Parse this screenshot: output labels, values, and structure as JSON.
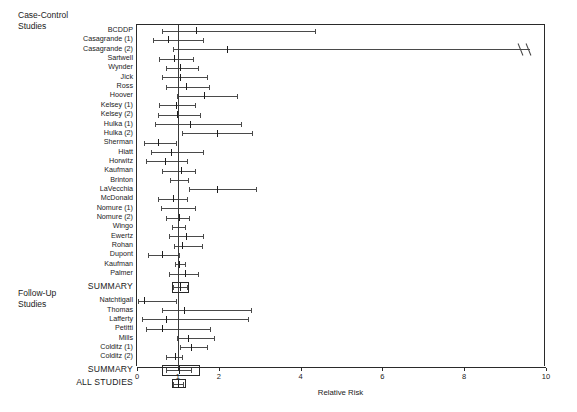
{
  "figure": {
    "axis_title": "Relative Risk",
    "x_ticks": [
      {
        "value": 0,
        "label": "0"
      },
      {
        "value": 1,
        "label": "1"
      },
      {
        "value": 2,
        "label": "2"
      },
      {
        "value": 4,
        "label": "4"
      },
      {
        "value": 6,
        "label": "6"
      },
      {
        "value": 8,
        "label": "8"
      },
      {
        "value": 10,
        "label": "10"
      }
    ],
    "reference_line": 1,
    "group_titles": [
      {
        "name": "case-control-group-title",
        "line1": "Case-Control",
        "line2": "Studies"
      },
      {
        "name": "follow-up-group-title",
        "line1": "Follow-Up",
        "line2": "Studies"
      }
    ]
  },
  "chart_data": {
    "type": "forest",
    "title": "",
    "xlabel": "Relative Risk",
    "ylabel": "",
    "xlim": [
      0,
      10
    ],
    "xticks": [
      0,
      1,
      2,
      4,
      6,
      8,
      10
    ],
    "grid": false,
    "legend": "none",
    "reference_line": 1,
    "groups": [
      {
        "name": "Case-Control Studies",
        "studies": [
          {
            "label": "BCDDP",
            "estimate": 1.45,
            "low": 0.6,
            "high": 4.35,
            "truncated_high": false
          },
          {
            "label": "Casagrande (1)",
            "estimate": 0.75,
            "low": 0.38,
            "high": 1.62,
            "truncated_high": false
          },
          {
            "label": "Casagrande  (2)",
            "estimate": 2.2,
            "low": 0.88,
            "high": 9.6,
            "truncated_high": true
          },
          {
            "label": "Sartwell",
            "estimate": 0.9,
            "low": 0.55,
            "high": 1.38,
            "truncated_high": false
          },
          {
            "label": "Wynder",
            "estimate": 1.05,
            "low": 0.72,
            "high": 1.5,
            "truncated_high": false
          },
          {
            "label": "Jick",
            "estimate": 1.05,
            "low": 0.6,
            "high": 1.72,
            "truncated_high": false
          },
          {
            "label": "Ross",
            "estimate": 1.2,
            "low": 0.72,
            "high": 1.75,
            "truncated_high": false
          },
          {
            "label": "Hoover",
            "estimate": 1.65,
            "low": 0.98,
            "high": 2.45,
            "truncated_high": false
          },
          {
            "label": "Kelsey (1)",
            "estimate": 0.95,
            "low": 0.55,
            "high": 1.42,
            "truncated_high": false
          },
          {
            "label": "Kelsey (2)",
            "estimate": 0.98,
            "low": 0.52,
            "high": 1.55,
            "truncated_high": false
          },
          {
            "label": "Hulka (1)",
            "estimate": 1.3,
            "low": 0.45,
            "high": 2.55,
            "truncated_high": false
          },
          {
            "label": "Hulka (2)",
            "estimate": 1.95,
            "low": 1.1,
            "high": 2.82,
            "truncated_high": false
          },
          {
            "label": "Sherman",
            "estimate": 0.52,
            "low": 0.18,
            "high": 0.95,
            "truncated_high": false
          },
          {
            "label": "Hiatt",
            "estimate": 0.82,
            "low": 0.35,
            "high": 1.62,
            "truncated_high": false
          },
          {
            "label": "Horwitz",
            "estimate": 0.68,
            "low": 0.22,
            "high": 1.22,
            "truncated_high": false
          },
          {
            "label": "Kaufman",
            "estimate": 1.08,
            "low": 0.62,
            "high": 1.42,
            "truncated_high": false
          },
          {
            "label": "Brinton",
            "estimate": 1.0,
            "low": 0.8,
            "high": 1.25,
            "truncated_high": false
          },
          {
            "label": "LaVecchia",
            "estimate": 1.95,
            "low": 1.28,
            "high": 2.9,
            "truncated_high": false
          },
          {
            "label": "McDonald",
            "estimate": 0.88,
            "low": 0.52,
            "high": 1.22,
            "truncated_high": false
          },
          {
            "label": "Nomure (1)",
            "estimate": 1.0,
            "low": 0.58,
            "high": 1.42,
            "truncated_high": false
          },
          {
            "label": "Nomure (2)",
            "estimate": 1.02,
            "low": 0.72,
            "high": 1.28,
            "truncated_high": false
          },
          {
            "label": "Wingo",
            "estimate": 1.0,
            "low": 0.85,
            "high": 1.18,
            "truncated_high": false
          },
          {
            "label": "Ewertz",
            "estimate": 1.2,
            "low": 0.78,
            "high": 1.62,
            "truncated_high": false
          },
          {
            "label": "Rohan",
            "estimate": 1.1,
            "low": 0.9,
            "high": 1.6,
            "truncated_high": false
          },
          {
            "label": "Dupont",
            "estimate": 0.62,
            "low": 0.28,
            "high": 1.02,
            "truncated_high": false
          },
          {
            "label": "Kaufman",
            "estimate": 1.02,
            "low": 0.92,
            "high": 1.18,
            "truncated_high": false
          },
          {
            "label": "Palmer",
            "estimate": 1.18,
            "low": 0.78,
            "high": 1.5,
            "truncated_high": false
          }
        ],
        "summary": {
          "label": "SUMMARY",
          "estimate": 1.05,
          "low": 0.88,
          "high": 1.22,
          "box_low": 0.85,
          "box_high": 1.28
        }
      },
      {
        "name": "Follow-Up Studies",
        "studies": [
          {
            "label": "Natchtigall",
            "estimate": 0.18,
            "low": 0.02,
            "high": 0.95,
            "truncated_high": false
          },
          {
            "label": "Thomas",
            "estimate": 1.15,
            "low": 0.62,
            "high": 2.78,
            "truncated_high": false
          },
          {
            "label": "Lafferty",
            "estimate": 0.72,
            "low": 0.12,
            "high": 2.72,
            "truncated_high": false
          },
          {
            "label": "Petitti",
            "estimate": 0.62,
            "low": 0.22,
            "high": 1.78,
            "truncated_high": false
          },
          {
            "label": "Mills",
            "estimate": 1.25,
            "low": 0.98,
            "high": 1.88,
            "truncated_high": false
          },
          {
            "label": "Colditz (1)",
            "estimate": 1.32,
            "low": 1.05,
            "high": 1.72,
            "truncated_high": false
          },
          {
            "label": "Colditz (2)",
            "estimate": 0.92,
            "low": 0.72,
            "high": 1.1,
            "truncated_high": false
          }
        ],
        "summary": {
          "label": "SUMMARY",
          "estimate": 1.02,
          "low": 0.72,
          "high": 1.32,
          "box_low": 0.62,
          "box_high": 1.55
        }
      }
    ],
    "overall": {
      "label": "ALL STUDIES",
      "estimate": 1.0,
      "low": 0.88,
      "high": 1.12,
      "box_low": 0.86,
      "box_high": 1.2
    }
  }
}
